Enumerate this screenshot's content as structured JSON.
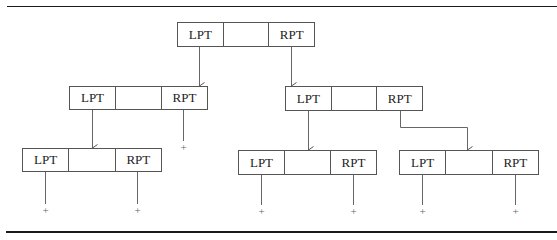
{
  "diagram": {
    "type": "binary-tree-node-structure",
    "cell_labels": {
      "left": "LPT",
      "middle": "",
      "right": "RPT"
    },
    "null_marker": "+",
    "nodes": [
      {
        "id": "root",
        "left": "LPT",
        "middle": "",
        "right": "RPT"
      },
      {
        "id": "left-child",
        "left": "LPT",
        "middle": "",
        "right": "RPT"
      },
      {
        "id": "right-child",
        "left": "LPT",
        "middle": "",
        "right": "RPT"
      },
      {
        "id": "left-left-child",
        "left": "LPT",
        "middle": "",
        "right": "RPT"
      },
      {
        "id": "right-left-child",
        "left": "LPT",
        "middle": "",
        "right": "RPT"
      },
      {
        "id": "right-right-child",
        "left": "LPT",
        "middle": "",
        "right": "RPT"
      }
    ],
    "edges": [
      {
        "from": "root.LPT",
        "to": "left-child"
      },
      {
        "from": "root.RPT",
        "to": "right-child"
      },
      {
        "from": "left-child.LPT",
        "to": "left-left-child"
      },
      {
        "from": "left-child.RPT",
        "to": "null"
      },
      {
        "from": "right-child.LPT",
        "to": "right-left-child"
      },
      {
        "from": "right-child.RPT",
        "to": "right-right-child"
      },
      {
        "from": "left-left-child.LPT",
        "to": "null"
      },
      {
        "from": "left-left-child.RPT",
        "to": "null"
      },
      {
        "from": "right-left-child.LPT",
        "to": "null"
      },
      {
        "from": "right-left-child.RPT",
        "to": "null"
      },
      {
        "from": "right-right-child.LPT",
        "to": "null"
      },
      {
        "from": "right-right-child.RPT",
        "to": "null"
      }
    ],
    "colors": {
      "line": "#555555",
      "rule": "#1a1a1a",
      "text": "#222222",
      "null_marker": "#666666"
    }
  }
}
